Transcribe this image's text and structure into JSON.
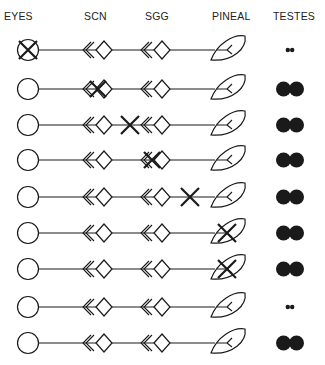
{
  "headers": {
    "eyes": "EYES",
    "scn": "SCN",
    "sgg": "SGG",
    "pineal": "PINEAL",
    "testes": "TESTES"
  },
  "rows": [
    {
      "lesion": "eyes",
      "testes": "small"
    },
    {
      "lesion": "scn",
      "testes": "large"
    },
    {
      "lesion": "scn-sgg-pathway",
      "testes": "large"
    },
    {
      "lesion": "sgg",
      "testes": "large"
    },
    {
      "lesion": "sgg-pineal-pathway",
      "testes": "large"
    },
    {
      "lesion": "pineal",
      "testes": "large"
    },
    {
      "lesion": "pineal",
      "testes": "large"
    },
    {
      "lesion": "none",
      "testes": "small"
    },
    {
      "lesion": "none",
      "testes": "large"
    }
  ],
  "colors": {
    "ink": "#1a1a1a",
    "background": "#ffffff"
  }
}
